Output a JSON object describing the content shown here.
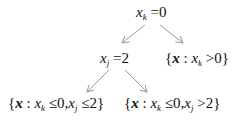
{
  "diagram": {
    "type": "decision-tree",
    "edge_color": "#9a9a9a",
    "text_color": "#111111",
    "nodes": [
      {
        "id": "root",
        "label": "x_k = 0",
        "var": "x",
        "sub": "k",
        "op": "=",
        "value": "0"
      },
      {
        "id": "split_j",
        "label": "x_j = 2",
        "var": "x",
        "sub": "j",
        "op": "=",
        "value": "2"
      },
      {
        "id": "leaf_k_pos",
        "label": "{x : x_k > 0}",
        "set_var": "x",
        "cond1_var": "x",
        "cond1_sub": "k",
        "cond1_op": ">",
        "cond1_val": "0}"
      },
      {
        "id": "leaf_j_le",
        "label": "{x : x_k ≤ 0, x_j ≤ 2}",
        "set_var": "x",
        "cond1_var": "x",
        "cond1_sub": "k",
        "cond1_op": "≤",
        "cond1_val": "0,",
        "cond2_var": "x",
        "cond2_sub": "j",
        "cond2_op": "≤",
        "cond2_val": "2}"
      },
      {
        "id": "leaf_j_gt",
        "label": "{x : x_k ≤ 0, x_j > 2}",
        "set_var": "x",
        "cond1_var": "x",
        "cond1_sub": "k",
        "cond1_op": "≤",
        "cond1_val": "0,",
        "cond2_var": "x",
        "cond2_sub": "j",
        "cond2_op": ">",
        "cond2_val": "2}"
      }
    ],
    "edges": [
      {
        "from": "root",
        "to": "split_j"
      },
      {
        "from": "root",
        "to": "leaf_k_pos"
      },
      {
        "from": "split_j",
        "to": "leaf_j_le"
      },
      {
        "from": "split_j",
        "to": "leaf_j_gt"
      }
    ],
    "brace_open": "{",
    "colon": " : "
  }
}
